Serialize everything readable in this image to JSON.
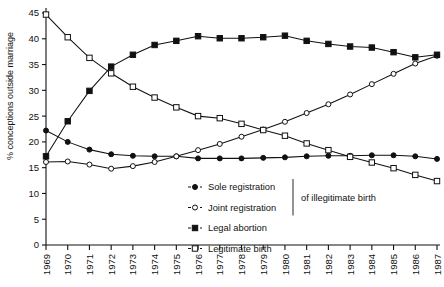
{
  "chart_data": {
    "type": "line",
    "title": "",
    "xlabel": "",
    "ylabel": "% conceptions outside marriage",
    "ylim": [
      0,
      45
    ],
    "yticks": [
      0,
      5,
      10,
      15,
      20,
      25,
      30,
      35,
      40,
      45
    ],
    "grid": false,
    "legend_position": "inside-bottom-center",
    "legend_bracket_note": "of illegitimate birth",
    "categories": [
      "1969",
      "1970",
      "1971",
      "1972",
      "1973",
      "1974",
      "1975",
      "1976",
      "1977",
      "1978",
      "1979",
      "1980",
      "1981",
      "1982",
      "1983",
      "1984",
      "1985",
      "1986",
      "1987"
    ],
    "series": [
      {
        "name": "Sole registration",
        "marker": "filled-circle",
        "values": [
          22.2,
          20.0,
          18.5,
          17.6,
          17.3,
          17.2,
          17.2,
          16.8,
          16.8,
          16.8,
          16.9,
          17.0,
          17.2,
          17.3,
          17.3,
          17.4,
          17.4,
          17.2,
          16.7
        ]
      },
      {
        "name": "Joint registration",
        "marker": "open-circle",
        "values": [
          16.1,
          16.2,
          15.6,
          14.8,
          15.3,
          16.1,
          17.2,
          18.4,
          19.6,
          21.0,
          22.4,
          23.9,
          25.6,
          27.3,
          29.2,
          31.2,
          33.2,
          35.2,
          36.7
        ]
      },
      {
        "name": "Legal abortion",
        "marker": "filled-square",
        "values": [
          17.2,
          24.0,
          29.9,
          34.6,
          36.9,
          38.8,
          39.6,
          40.5,
          40.1,
          40.1,
          40.3,
          40.6,
          39.6,
          39.0,
          38.5,
          38.3,
          37.4,
          36.4,
          36.9
        ]
      },
      {
        "name": "Legitimate birth",
        "marker": "open-square",
        "values": [
          44.7,
          40.3,
          36.3,
          33.3,
          30.7,
          28.6,
          26.7,
          25.0,
          24.6,
          23.5,
          22.3,
          21.2,
          19.7,
          18.4,
          17.1,
          16.0,
          14.9,
          13.6,
          12.4
        ]
      }
    ]
  },
  "legend": {
    "items": [
      {
        "label": "Sole registration",
        "marker": "filled-circle"
      },
      {
        "label": "Joint registration",
        "marker": "open-circle"
      },
      {
        "label": "Legal abortion",
        "marker": "filled-square"
      },
      {
        "label": "Legitimate birth",
        "marker": "open-square"
      }
    ],
    "bracket_note": "of illegitimate birth"
  }
}
